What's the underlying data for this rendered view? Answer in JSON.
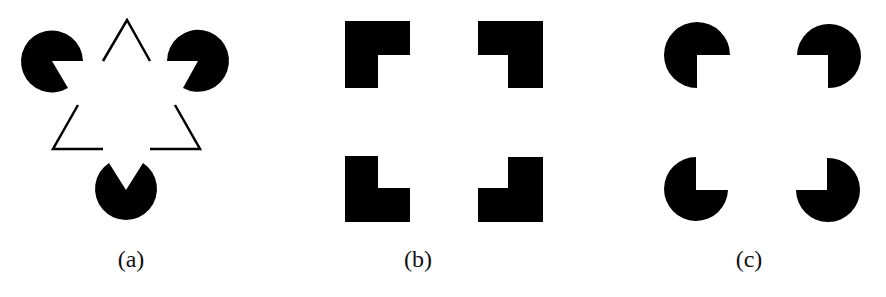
{
  "figure": {
    "panels": [
      {
        "id": "a",
        "label": "(a)",
        "description": "Kanizsa triangle: three pac-man inducers and line-corner fragments"
      },
      {
        "id": "b",
        "label": "(b)",
        "description": "Illusory square induced by four L-shaped corner blocks"
      },
      {
        "id": "c",
        "label": "(c)",
        "description": "Kanizsa square induced by four three-quarter discs"
      }
    ],
    "colors": {
      "foreground": "#000000",
      "background": "#ffffff"
    }
  }
}
